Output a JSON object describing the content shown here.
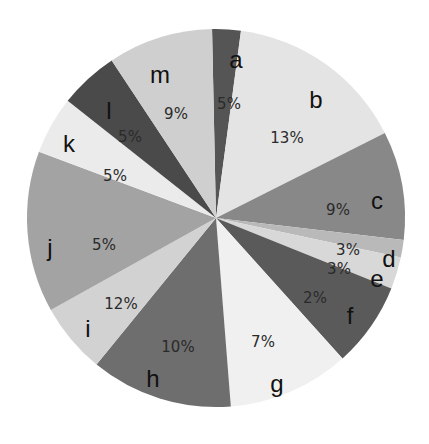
{
  "chart_data": {
    "type": "pie",
    "title": "",
    "legend": "none",
    "labels_position": "inside",
    "center": [
      216,
      218
    ],
    "radius": 189,
    "slices": [
      {
        "label": "a",
        "value_label": "5%",
        "start_deg": -1.2,
        "end_deg": 7.6,
        "color": "#555555"
      },
      {
        "label": "b",
        "value_label": "13%",
        "start_deg": 7.6,
        "end_deg": 63.3,
        "color": "#e4e4e4"
      },
      {
        "label": "c",
        "value_label": "9%",
        "start_deg": 63.3,
        "end_deg": 96.7,
        "color": "#888888"
      },
      {
        "label": "d",
        "value_label": "3%",
        "start_deg": 96.7,
        "end_deg": 102.1,
        "color": "#b9b9b9"
      },
      {
        "label": "e",
        "value_label": "3%",
        "start_deg": 102.1,
        "end_deg": 111.9,
        "color": "#d8d8d8"
      },
      {
        "label": "f",
        "value_label": "2%",
        "start_deg": 111.9,
        "end_deg": 138.0,
        "color": "#5a5a5a"
      },
      {
        "label": "g",
        "value_label": "7%",
        "start_deg": 138.0,
        "end_deg": 175.5,
        "color": "#f0f0f0"
      },
      {
        "label": "h",
        "value_label": "10%",
        "start_deg": 175.5,
        "end_deg": 219.2,
        "color": "#6e6e6e"
      },
      {
        "label": "i",
        "value_label": "12%",
        "start_deg": 219.2,
        "end_deg": 240.9,
        "color": "#d2d2d2"
      },
      {
        "label": "j",
        "value_label": "5%",
        "start_deg": 240.9,
        "end_deg": 290.5,
        "color": "#a3a3a3"
      },
      {
        "label": "k",
        "value_label": "5%",
        "start_deg": 290.5,
        "end_deg": 308.3,
        "color": "#ebebeb"
      },
      {
        "label": "l",
        "value_label": "5%",
        "start_deg": 308.3,
        "end_deg": 326.5,
        "color": "#4a4a4a"
      },
      {
        "label": "m",
        "value_label": "9%",
        "start_deg": 326.5,
        "end_deg": 358.8,
        "color": "#cfcfcf"
      }
    ],
    "label_positions": {
      "a": {
        "name": [
          236,
          62
        ],
        "pct": [
          229,
          104
        ]
      },
      "b": {
        "name": [
          316,
          102
        ],
        "pct": [
          287,
          138
        ]
      },
      "c": {
        "name": [
          377,
          203
        ],
        "pct": [
          338,
          210
        ]
      },
      "d": {
        "name": [
          389,
          261
        ],
        "pct": [
          348,
          250
        ]
      },
      "e": {
        "name": [
          377,
          281
        ],
        "pct": [
          339,
          269
        ]
      },
      "f": {
        "name": [
          350,
          318
        ],
        "pct": [
          315,
          298
        ]
      },
      "g": {
        "name": [
          277,
          386
        ],
        "pct": [
          263,
          342
        ]
      },
      "h": {
        "name": [
          153,
          381
        ],
        "pct": [
          178,
          347
        ]
      },
      "i": {
        "name": [
          88,
          331
        ],
        "pct": [
          121,
          304
        ]
      },
      "j": {
        "name": [
          50,
          250
        ],
        "pct": [
          104,
          245
        ]
      },
      "k": {
        "name": [
          69,
          146
        ],
        "pct": [
          115,
          176
        ]
      },
      "l": {
        "name": [
          109,
          113
        ],
        "pct": [
          130,
          137
        ]
      },
      "m": {
        "name": [
          160,
          77
        ],
        "pct": [
          176,
          114
        ]
      }
    }
  }
}
